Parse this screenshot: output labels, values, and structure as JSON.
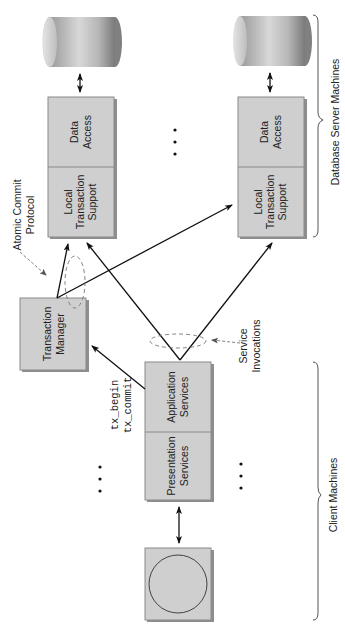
{
  "diagram": {
    "type": "distributed-transaction-architecture",
    "orientation": "rotated-90-ccw",
    "server_side": {
      "group_label": "Database Server Machines",
      "servers": [
        {
          "top_label": "Data Access",
          "bottom_label": "Local Transaction Support",
          "database": "database-cylinder"
        },
        {
          "top_label": "Data Access",
          "bottom_label": "Local Transaction Support",
          "database": "database-cylinder"
        }
      ],
      "ellipsis": "• • •"
    },
    "transaction_manager": {
      "label": "Transaction Manager"
    },
    "client_side": {
      "group_label": "Client Machines",
      "client": {
        "top_label": "Application Services",
        "bottom_label": "Presentation Services",
        "terminal": "client-terminal-circle"
      },
      "ellipsis_left": "• • •",
      "ellipsis_right": "• • •"
    },
    "annotations": {
      "atomic_commit": "Atomic Commit Protocol",
      "service_invocations": "Service Invocations",
      "tx_calls": [
        "tx_begin",
        "tx_commit"
      ]
    },
    "colors": {
      "box_fill": "#cfcfcf",
      "box_shadow": "#8e8e8e",
      "arrow": "#111111",
      "dashed": "#777777"
    }
  },
  "text": {
    "data_access_1": "Data",
    "data_access_2": "Access",
    "lts_1": "Local",
    "lts_2": "Transaction",
    "lts_3": "Support",
    "tm_1": "Transaction",
    "tm_2": "Manager",
    "app_1": "Application",
    "app_2": "Services",
    "pres_1": "Presentation",
    "pres_2": "Services",
    "acp_1": "Atomic Commit",
    "acp_2": "Protocol",
    "si_1": "Service",
    "si_2": "Invocations",
    "tx_begin": "tx_begin",
    "tx_commit": "tx_commit",
    "db_group": "Database Server Machines",
    "client_group": "Client Machines"
  }
}
